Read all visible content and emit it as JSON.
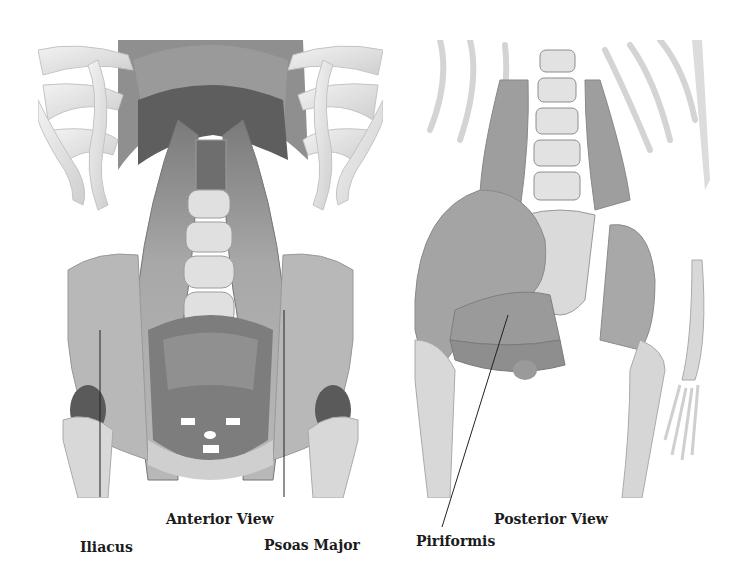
{
  "figure": {
    "panels": [
      {
        "id": "anterior",
        "caption": "Anterior View"
      },
      {
        "id": "posterior",
        "caption": "Posterior View"
      }
    ],
    "labels": {
      "iliacus": "Iliacus",
      "psoas_major": "Psoas Major",
      "piriformis": "Piriformis"
    },
    "colors": {
      "background": "#ffffff",
      "bone": "#e6e6e6",
      "muscle": "#a9a9a9",
      "muscle_dark": "#8a8a8a",
      "shadow": "#5c5c5c",
      "text": "#1b1b1b",
      "leader_line": "#222222"
    }
  }
}
